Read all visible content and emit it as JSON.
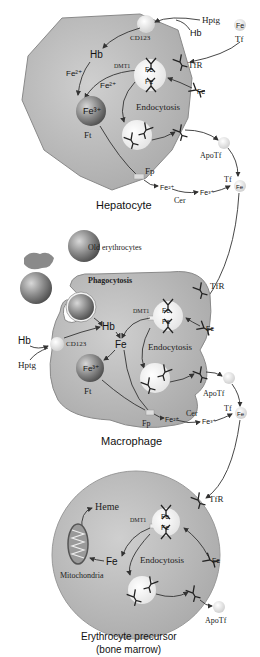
{
  "colors": {
    "cell_fill": "#bdbdbd",
    "cell_stroke": "#8a8a8a",
    "ferritin_fill": "#7d7d7d",
    "vesicle_fill": "#f4f4f4",
    "text": "#222222"
  },
  "hepatocyte": {
    "caption": "Hepatocyte",
    "labels": {
      "hptg": "Hptg",
      "hb_outside": "Hb",
      "cd163": "CD123",
      "tf_fe": "Fe",
      "tf": "Tf",
      "tfr": "TfR",
      "tfr_fe": "Fe",
      "hb_inside": "Hb",
      "fe2_a": "Fe²⁺",
      "fe2_b": "Fe²⁺",
      "dmt1": "DMT1",
      "endo_fe_top": "Fe",
      "endo_fe_bottom": "Fe",
      "ferritin_fe": "Fe³⁺",
      "ft": "Ft",
      "endocytosis": "Endocytosis",
      "apotf": "ApoTf",
      "fp": "Fp",
      "fe2_out": "Fe²⁺",
      "cer": "Cer",
      "fe3_out": "Fe³⁺",
      "tf_out": "Tf",
      "tf_out_fe": "Fe"
    }
  },
  "macrophage": {
    "caption": "Macrophage",
    "labels": {
      "old_erythrocytes": "Old erythrocytes",
      "phagocytosis": "Phagocytosis",
      "hb_outside": "Hb",
      "hptg": "Hptg",
      "cd163": "CD123",
      "hb_inside": "Hb",
      "fe": "Fe",
      "ferritin_fe": "Fe³⁺",
      "ft": "Ft",
      "dmt1": "DMT1",
      "endo_fe_top": "Fe",
      "endo_fe_bottom": "Fe",
      "endocytosis": "Endocytosis",
      "tfr": "TfR",
      "tfr_fe": "Fe",
      "apotf": "ApoTf",
      "fp": "Fp",
      "fe2_out": "Fe²⁺",
      "cer": "Cer",
      "fe3_out": "Fe³⁺",
      "tf_out": "Tf",
      "tf_out_fe": "Fe"
    }
  },
  "erythrocyte_precursor": {
    "caption_line1": "Erythrocyte precursor",
    "caption_line2": "(bone marrow)",
    "labels": {
      "tfr": "TfR",
      "heme": "Heme",
      "dmt1": "DMT1",
      "endo_fe_top": "Fe",
      "endo_fe_bottom": "Fe",
      "fe": "Fe",
      "mitochondria": "Mitochondria",
      "endocytosis": "Endocytosis",
      "tfr_fe": "Fe",
      "apotf": "ApoTf"
    }
  }
}
